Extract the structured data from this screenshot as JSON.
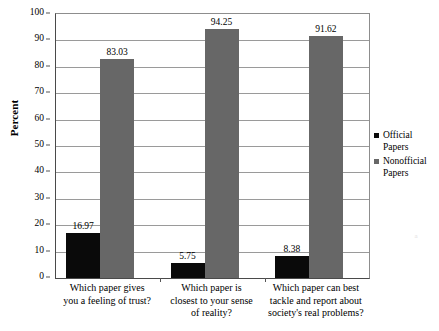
{
  "chart_data": {
    "type": "bar",
    "title": "",
    "xlabel": "",
    "ylabel": "Percent",
    "ylim": [
      0,
      100
    ],
    "ytick_step": 10,
    "yticks": [
      "100",
      "90",
      "80",
      "70",
      "60",
      "50",
      "40",
      "30",
      "20",
      "10",
      "0"
    ],
    "grid": true,
    "legend_position": "right",
    "categories": [
      "Which paper gives\nyou a feeling of trust?",
      "Which paper is\nclosest to your sense\nof reality?",
      "Which paper can best\ntackle and report about\nsociety's real problems?"
    ],
    "category_lines": [
      [
        "Which paper gives",
        "you a feeling of trust?"
      ],
      [
        "Which paper is",
        "closest to your sense",
        "of reality?"
      ],
      [
        "Which paper can best",
        "tackle and report about",
        "society's real problems?"
      ]
    ],
    "series": [
      {
        "name": "Official Papers",
        "color": "#0a0a0a",
        "values": [
          16.97,
          5.75,
          8.38
        ],
        "labels": [
          "16.97",
          "5.75",
          "8.38"
        ]
      },
      {
        "name": "Nonofficial Papers",
        "color": "#676767",
        "values": [
          83.03,
          94.25,
          91.62
        ],
        "labels": [
          "83.03",
          "94.25",
          "91.62"
        ]
      }
    ]
  },
  "legend": {
    "entries": [
      {
        "label_line1": "Official",
        "label_line2": "Papers",
        "swatch": "official-swatch"
      },
      {
        "label_line1": "Nonofficial",
        "label_line2": "Papers",
        "swatch": "nonofficial-swatch"
      }
    ]
  },
  "artifact": {
    "text": "a"
  }
}
